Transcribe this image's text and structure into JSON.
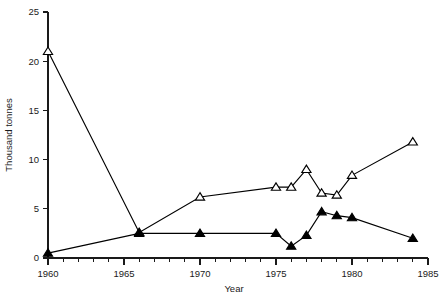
{
  "chart_data": {
    "type": "line",
    "title": "",
    "xlabel": "Year",
    "ylabel": "Thousand tonnes",
    "xlim": [
      1960,
      1985
    ],
    "ylim": [
      0,
      25
    ],
    "xticks": [
      1960,
      1965,
      1970,
      1975,
      1980,
      1985
    ],
    "xtick_labels": [
      "1960",
      "1965",
      "1970",
      "1975",
      "1980",
      "1985"
    ],
    "yticks": [
      0,
      5,
      10,
      15,
      20,
      25
    ],
    "ytick_labels": [
      "0",
      "5",
      "10",
      "15",
      "20",
      "25"
    ],
    "minor_xtick_interval": 1,
    "grid": false,
    "legend": "none",
    "series": [
      {
        "name": "open-triangle-series",
        "marker": "triangle-open",
        "x": [
          1960,
          1966,
          1970,
          1975,
          1976,
          1977,
          1978,
          1979,
          1980,
          1984
        ],
        "values": [
          21.0,
          2.6,
          6.2,
          7.2,
          7.2,
          9.0,
          6.6,
          6.4,
          8.4,
          11.8
        ]
      },
      {
        "name": "filled-triangle-series",
        "marker": "triangle-filled",
        "x": [
          1960,
          1966,
          1970,
          1975,
          1976,
          1977,
          1978,
          1979,
          1980,
          1984
        ],
        "values": [
          0.5,
          2.5,
          2.5,
          2.5,
          1.2,
          2.3,
          4.7,
          4.3,
          4.1,
          2.0
        ]
      }
    ]
  },
  "axis_titles": {
    "x": "Year",
    "y": "Thousand tonnes"
  }
}
